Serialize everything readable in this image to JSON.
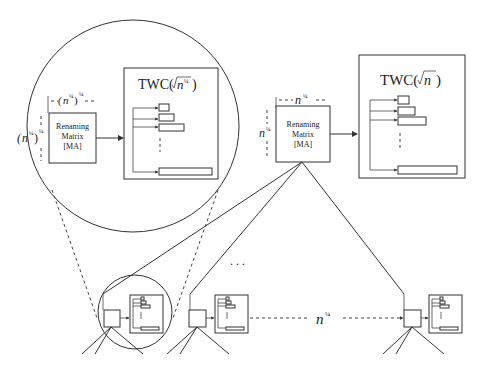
{
  "zoom_view": {
    "matrix": {
      "line1": "Renaming",
      "line2": "Matrix",
      "line3": "[MA]"
    },
    "width_label": "(n^¼)^¼",
    "height_label": "(n^¼)^¼",
    "twc_title": "TWC(√n^¼ )"
  },
  "top_view": {
    "matrix": {
      "line1": "Renaming",
      "line2": "Matrix",
      "line3": "[MA]"
    },
    "width_label": "n^¼",
    "height_label": "n^¼",
    "twc_title": "TWC(√n )"
  },
  "bottom_row": {
    "ellipsis": ". . .",
    "spacing_label": "n^¼"
  },
  "labels": {
    "zoom_w_base": "(n",
    "zoom_w_inner_exp": "¼",
    "zoom_w_outer_exp": "¼",
    "twc_zoom_prefix": "TWC(",
    "twc_zoom_n": "n",
    "twc_zoom_exp": "¼",
    "twc_zoom_suffix": " )",
    "twc_top_prefix": "TWC(",
    "twc_top_n": "n",
    "twc_top_suffix": " )",
    "n": "n",
    "quarter": "¼",
    "paren_open": "(",
    "paren_close": ")"
  }
}
